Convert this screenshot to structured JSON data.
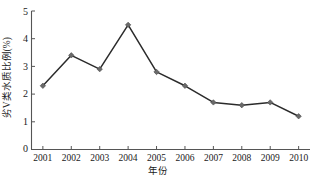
{
  "chart_data": {
    "type": "line",
    "title": "",
    "subtitle": "",
    "xlabel": "年份",
    "ylabel": "劣V类水质比例(%)",
    "categories": [
      "2001",
      "2002",
      "2003",
      "2004",
      "2005",
      "2006",
      "2007",
      "2008",
      "2009",
      "2010"
    ],
    "x": [
      2001,
      2002,
      2003,
      2004,
      2005,
      2006,
      2007,
      2008,
      2009,
      2010
    ],
    "values": [
      2.3,
      3.4,
      2.9,
      4.5,
      2.8,
      2.3,
      1.7,
      1.6,
      1.7,
      1.2
    ],
    "series": [
      {
        "name": "劣V类水质比例(%)",
        "values": [
          2.3,
          3.4,
          2.9,
          4.5,
          2.8,
          2.3,
          1.7,
          1.6,
          1.7,
          1.2
        ]
      }
    ],
    "xlim": [
      2000.6,
      2010.4
    ],
    "ylim": [
      0,
      5
    ],
    "ytick_labels": [
      "0",
      "1",
      "2",
      "3",
      "4",
      "5"
    ],
    "ytick_values": [
      0,
      1,
      2,
      3,
      4,
      5
    ],
    "xtick_labels": [
      "2001",
      "2002",
      "2003",
      "2004",
      "2005",
      "2006",
      "2007",
      "2008",
      "2009",
      "2010"
    ],
    "grid": false,
    "legend": false,
    "legend_position": "none",
    "annotations": [],
    "colors": {
      "line": "#2b2b2b",
      "marker": "#6a6a6a",
      "marker_edge": "#4a4a4a",
      "axis": "#555555",
      "text": "#1a1a1a",
      "background": "#ffffff"
    },
    "marker_shape": "diamond"
  },
  "accessibility": {
    "chart_description": "劣V类水质比例(%) 随 年份 变化折线图，2001 至 2010 年"
  }
}
